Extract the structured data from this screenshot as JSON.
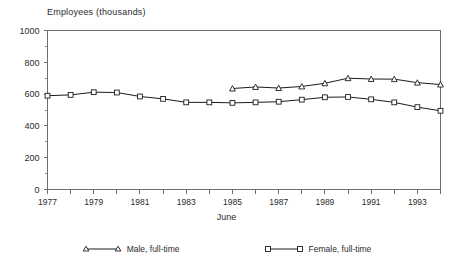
{
  "chart_data": {
    "type": "line",
    "title": "Employees  (thousands)",
    "xlabel": "June",
    "ylabel": "",
    "ylim": [
      0,
      1000
    ],
    "xlim": [
      1977,
      1994
    ],
    "ytick_values": [
      0,
      200,
      400,
      600,
      800,
      1000
    ],
    "ytick_labels": [
      "0",
      "200",
      "400",
      "600",
      "800",
      "1000"
    ],
    "yminor_values": [
      100,
      300,
      500,
      700,
      900
    ],
    "xtick_values": [
      1977,
      1978,
      1979,
      1980,
      1981,
      1982,
      1983,
      1984,
      1985,
      1986,
      1987,
      1988,
      1989,
      1990,
      1991,
      1992,
      1993,
      1994
    ],
    "xtick_labels": [
      "1977",
      "",
      "1979",
      "",
      "1981",
      "",
      "1983",
      "",
      "1985",
      "",
      "1987",
      "",
      "1989",
      "",
      "1991",
      "",
      "1993",
      ""
    ],
    "grid": false,
    "legend_position": "bottom",
    "series": [
      {
        "name": "Male, full-time",
        "marker": "triangle",
        "color": "#1c1c1c",
        "x": [
          1985,
          1986,
          1987,
          1988,
          1989,
          1990,
          1991,
          1992,
          1993,
          1994
        ],
        "values": [
          635,
          645,
          638,
          648,
          668,
          700,
          695,
          694,
          672,
          660
        ]
      },
      {
        "name": "Female, full-time",
        "marker": "square",
        "color": "#1c1c1c",
        "x": [
          1977,
          1978,
          1979,
          1980,
          1981,
          1982,
          1983,
          1984,
          1985,
          1986,
          1987,
          1988,
          1989,
          1990,
          1991,
          1992,
          1993,
          1994
        ],
        "values": [
          590,
          595,
          612,
          610,
          585,
          570,
          548,
          548,
          545,
          548,
          552,
          565,
          580,
          582,
          567,
          548,
          518,
          495
        ]
      }
    ]
  },
  "legend": {
    "entries": [
      {
        "label": "Male, full-time",
        "marker": "triangle-marker"
      },
      {
        "label": "Female, full-time",
        "marker": "square-marker"
      }
    ]
  }
}
